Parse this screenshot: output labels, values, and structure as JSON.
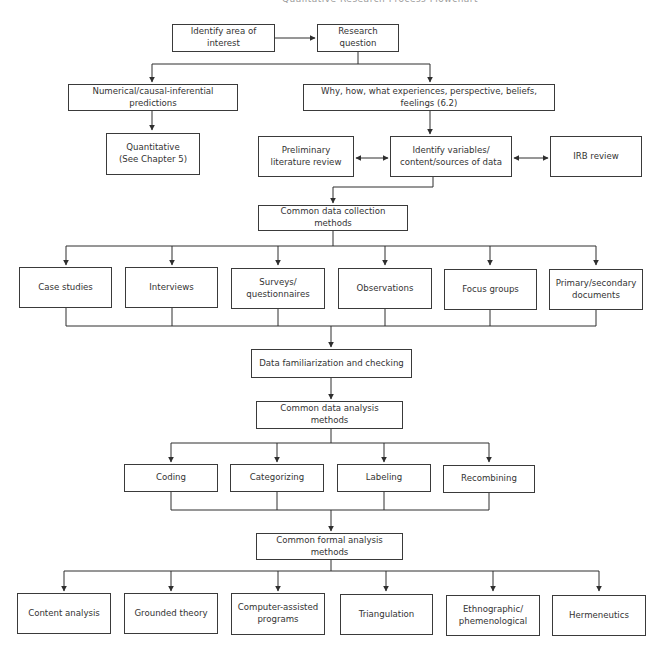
{
  "header": {
    "cut_title": "Qualitative Research Process Flowchart"
  },
  "nodes": {
    "identify_area": "Identify area of interest",
    "research_question": "Research question",
    "numerical": "Numerical/causal-inferential predictions",
    "why_how": "Why, how, what experiences, perspective, beliefs, feelings (6.2)",
    "quantitative": {
      "line1": "Quantitative",
      "line2": "(See Chapter 5)"
    },
    "preliminary": {
      "line1": "Preliminary",
      "line2": "literature review"
    },
    "identify_vars": {
      "line1": "Identify variables/",
      "line2": "content/sources of data"
    },
    "irb": "IRB review",
    "collection_methods": "Common data collection methods",
    "collection": [
      {
        "line1": "Case studies",
        "line2": ""
      },
      {
        "line1": "Interviews",
        "line2": ""
      },
      {
        "line1": "Surveys/",
        "line2": "questionnaires"
      },
      {
        "line1": "Observations",
        "line2": ""
      },
      {
        "line1": "Focus groups",
        "line2": ""
      },
      {
        "line1": "Primary/secondary",
        "line2": "documents"
      }
    ],
    "familiarization": "Data familiarization and checking",
    "analysis_methods": "Common data analysis methods",
    "analysis": [
      "Coding",
      "Categorizing",
      "Labeling",
      "Recombining"
    ],
    "formal_methods": "Common formal analysis methods",
    "formal": [
      {
        "line1": "Content analysis",
        "line2": ""
      },
      {
        "line1": "Grounded theory",
        "line2": ""
      },
      {
        "line1": "Computer-assisted",
        "line2": "programs"
      },
      {
        "line1": "Triangulation",
        "line2": ""
      },
      {
        "line1": "Ethnographic/",
        "line2": "phemenological"
      },
      {
        "line1": "Hermeneutics",
        "line2": ""
      }
    ]
  },
  "colors": {
    "line": "#2e2e2e",
    "box_border": "#3a3a3a",
    "text": "#333333",
    "background": "#ffffff"
  }
}
